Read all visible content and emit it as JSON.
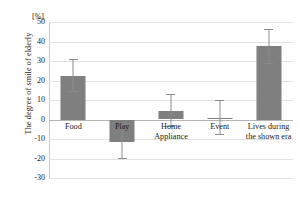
{
  "chart_data": {
    "type": "bar",
    "title": "",
    "subtitle": "",
    "xlabel": "",
    "ylabel": "The degree of smile of elderly",
    "unit_label": "[%]",
    "categories": [
      "Food",
      "Play",
      "Home\nAppliance",
      "Event",
      "Lives during\nthe shown era"
    ],
    "category_lines": [
      [
        "Food"
      ],
      [
        "Play"
      ],
      [
        "Home",
        "Appliance"
      ],
      [
        "Event"
      ],
      [
        "Lives during",
        "the shown era"
      ]
    ],
    "values": [
      22.5,
      -11.5,
      4.5,
      1.0,
      37.5
    ],
    "errors": [
      8.5,
      9.0,
      8.5,
      9.0,
      9.0
    ],
    "error_upper": [
      31.0,
      -2.5,
      13.0,
      10.0,
      46.5
    ],
    "error_lower": [
      14.0,
      -20.5,
      -4.0,
      -8.0,
      28.5
    ],
    "ylim": [
      -30,
      50
    ],
    "yticks": [
      50,
      40,
      30,
      20,
      10,
      0,
      -10,
      -20,
      -30
    ],
    "ytick_labels": [
      "50",
      "40",
      "30",
      "20",
      "10",
      "0",
      "-10",
      "-20",
      "-30"
    ],
    "grid": true,
    "legend": null,
    "legend_position": "none",
    "bar_color": "#7f7f7f",
    "error_color": "#8c8c8c",
    "gridline_color": "#e2e2e2",
    "zero_line_color": "#b4b4b4",
    "background_color": "#ffffff"
  }
}
